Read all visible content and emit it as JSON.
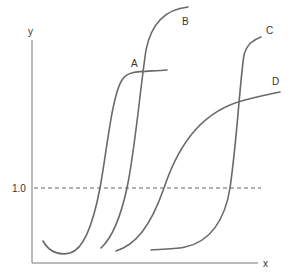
{
  "diagram": {
    "axes": {
      "x_label": "x",
      "y_label": "y"
    },
    "reference_line": {
      "label": "1.0",
      "style": "dashed"
    },
    "curves": [
      {
        "id": "A",
        "label": "A"
      },
      {
        "id": "B",
        "label": "B"
      },
      {
        "id": "C",
        "label": "C"
      },
      {
        "id": "D",
        "label": "D"
      }
    ],
    "colors": {
      "curve": "#6a6a6a",
      "axis": "#777777",
      "text": "#333333",
      "background": "#ffffff"
    }
  }
}
